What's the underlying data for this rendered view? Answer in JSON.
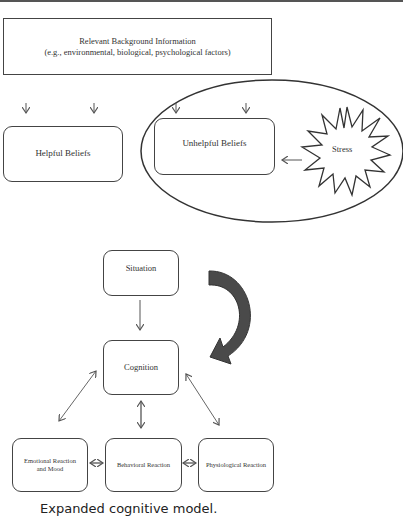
{
  "diagram": {
    "top_section": {
      "background_box": {
        "line1": "Relevant Background Information",
        "line2": "(e.g., environmental, biological, psychological factors)"
      },
      "helpful_beliefs": "Helpful Beliefs",
      "unhelpful_beliefs": "Unhelpful Beliefs",
      "stress": "Stress"
    },
    "bottom_section": {
      "situation": "Situation",
      "cognition": "Cognition",
      "emotional_line1": "Emotional Reaction",
      "emotional_line2": "and Mood",
      "behavioral": "Behavioral Reaction",
      "physiological": "Physiological Reaction"
    },
    "colors": {
      "line": "#444444",
      "curved_arrow": "#4a4a4a"
    }
  },
  "caption": "Expanded cognitive model."
}
